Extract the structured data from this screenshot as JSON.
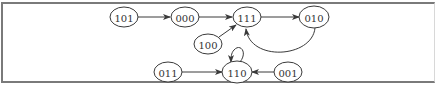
{
  "diagram": {
    "type": "state-transition-graph",
    "colors": {
      "stroke": "#3a3a3a",
      "text": "#333333",
      "border": "#7a7a7a"
    },
    "nodes": [
      {
        "id": "101",
        "label": "101",
        "cx": 124,
        "cy": 17
      },
      {
        "id": "000",
        "label": "000",
        "cx": 185,
        "cy": 17
      },
      {
        "id": "111",
        "label": "111",
        "cx": 247,
        "cy": 17
      },
      {
        "id": "010",
        "label": "010",
        "cx": 314,
        "cy": 17
      },
      {
        "id": "100",
        "label": "100",
        "cx": 208,
        "cy": 44
      },
      {
        "id": "011",
        "label": "011",
        "cx": 168,
        "cy": 72
      },
      {
        "id": "110",
        "label": "110",
        "cx": 237,
        "cy": 72
      },
      {
        "id": "001",
        "label": "001",
        "cx": 288,
        "cy": 72
      }
    ],
    "edges": [
      {
        "from": "101",
        "to": "000"
      },
      {
        "from": "000",
        "to": "111"
      },
      {
        "from": "111",
        "to": "010"
      },
      {
        "from": "010",
        "to": "111"
      },
      {
        "from": "100",
        "to": "111"
      },
      {
        "from": "011",
        "to": "110"
      },
      {
        "from": "001",
        "to": "110"
      },
      {
        "from": "110",
        "to": "110"
      }
    ]
  }
}
